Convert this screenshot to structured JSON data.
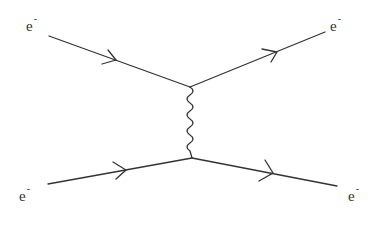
{
  "diagram": {
    "type": "feynman",
    "colors": {
      "line": "#333333",
      "background": "#ffffff"
    },
    "particles": {
      "in_top": {
        "symbol": "e",
        "charge": "-"
      },
      "out_top": {
        "symbol": "e",
        "charge": "-"
      },
      "in_bottom": {
        "symbol": "e",
        "charge": "-"
      },
      "out_bottom": {
        "symbol": "e",
        "charge": "-"
      }
    },
    "propagator": {
      "name": "photon",
      "style": "wavy"
    }
  }
}
